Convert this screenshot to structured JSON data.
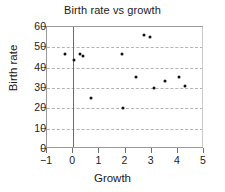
{
  "chart_data": {
    "type": "scatter",
    "title": "Birth rate vs growth",
    "xlabel": "Growth",
    "ylabel": "Birth rate",
    "xlim": [
      -1,
      5
    ],
    "ylim": [
      0,
      60
    ],
    "xticks": [
      -1,
      0,
      1,
      2,
      3,
      4,
      5
    ],
    "xtick_labels": [
      "−1",
      "0",
      "1",
      "2",
      "3",
      "4",
      "5"
    ],
    "yticks": [
      0,
      10,
      20,
      30,
      40,
      50,
      60
    ],
    "ytick_labels": [
      "0",
      "10",
      "20",
      "30",
      "40",
      "50",
      "60"
    ],
    "gridlines_y": [
      10,
      20,
      30,
      40,
      50
    ],
    "grid": true,
    "grid_style": "dashed",
    "legend": null,
    "marker": "dot",
    "marker_color": "#111111",
    "grid_color": "#b4b4b4",
    "axis_color": "#6e6e6e",
    "points": [
      {
        "x": -0.32,
        "y": 46.5
      },
      {
        "x": 0.02,
        "y": 44.0
      },
      {
        "x": 0.27,
        "y": 46.5
      },
      {
        "x": 0.38,
        "y": 45.8
      },
      {
        "x": 0.7,
        "y": 25.0
      },
      {
        "x": 1.88,
        "y": 46.5
      },
      {
        "x": 1.9,
        "y": 20.0
      },
      {
        "x": 2.42,
        "y": 35.4
      },
      {
        "x": 2.72,
        "y": 56.0
      },
      {
        "x": 2.92,
        "y": 55.2
      },
      {
        "x": 3.08,
        "y": 30.2
      },
      {
        "x": 3.5,
        "y": 33.2
      },
      {
        "x": 4.05,
        "y": 35.5
      },
      {
        "x": 4.27,
        "y": 31.2
      }
    ]
  }
}
